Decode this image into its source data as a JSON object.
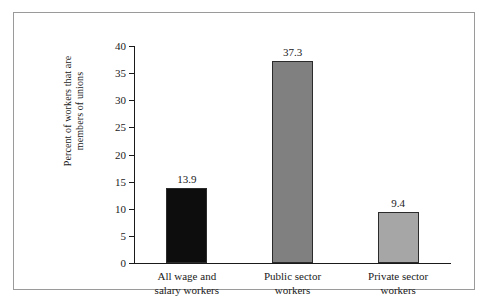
{
  "chart_data": {
    "type": "bar",
    "title": "",
    "subtitle": "",
    "xlabel": "",
    "ylabel": "Percent of workers that are members of unions",
    "ylabel_lines": [
      "Percent of workers that are",
      "members of unions"
    ],
    "categories": [
      "All wage and salary workers",
      "Public sector workers",
      "Private sector workers"
    ],
    "category_lines": [
      [
        "All wage and",
        "salary workers"
      ],
      [
        "Public sector",
        "workers"
      ],
      [
        "Private sector",
        "workers"
      ]
    ],
    "values": [
      13.9,
      37.3,
      9.4
    ],
    "value_labels": [
      "13.9",
      "37.3",
      "9.4"
    ],
    "bar_colors": [
      "#0d0d0d",
      "#808080",
      "#a6a6a6"
    ],
    "bar_border_color": "#2b2b2b",
    "ylim": [
      0,
      40
    ],
    "yticks": [
      0,
      5,
      10,
      15,
      20,
      25,
      30,
      35,
      40
    ],
    "ytick_labels": [
      "0",
      "5",
      "10",
      "15",
      "20",
      "25",
      "30",
      "35",
      "40"
    ],
    "grid": false,
    "legend": null,
    "legend_position": "none",
    "background_color": "#ffffff",
    "axis_color": "#1a1a1a",
    "frame_color": "#9a9a9a"
  }
}
